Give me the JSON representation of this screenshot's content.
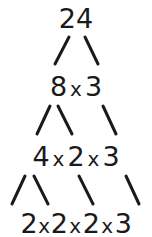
{
  "diagram": {
    "type": "factor-tree",
    "levels": [
      {
        "terms": [
          "24"
        ]
      },
      {
        "terms": [
          "8",
          "3"
        ]
      },
      {
        "terms": [
          "4",
          "2",
          "3"
        ]
      },
      {
        "terms": [
          "2",
          "2",
          "2",
          "3"
        ]
      }
    ],
    "operator": "x",
    "colors": {
      "ink": "#1a1a1a",
      "background": "#ffffff"
    }
  }
}
